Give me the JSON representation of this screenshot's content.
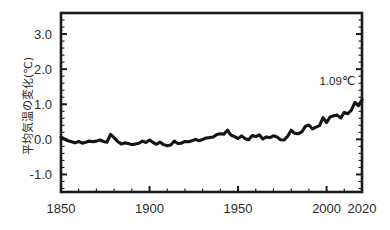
{
  "chart_data": {
    "type": "line",
    "title": "",
    "subtitle": "",
    "xlabel": "",
    "ylabel": "平均気温の変化(℃)",
    "xlim": [
      1850,
      2020
    ],
    "ylim": [
      -1.5,
      3.6
    ],
    "grid": false,
    "legend": null,
    "x_ticks": [
      1850,
      1900,
      1950,
      2000,
      2020
    ],
    "x_tick_labels": [
      "1850",
      "1900",
      "1950",
      "2000",
      "2020"
    ],
    "x_minor_step": 10,
    "y_ticks": [
      -1.0,
      0.0,
      1.0,
      2.0,
      3.0
    ],
    "y_tick_labels": [
      "-1.0",
      "0.0",
      "1.0",
      "2.0",
      "3.0"
    ],
    "y_minor_step": 0.2,
    "series": [
      {
        "name": "世界平均気温の変化",
        "color": "#141414",
        "x": [
          1850,
          1852,
          1854,
          1856,
          1858,
          1860,
          1862,
          1864,
          1866,
          1868,
          1870,
          1872,
          1874,
          1876,
          1878,
          1880,
          1882,
          1884,
          1886,
          1888,
          1890,
          1892,
          1894,
          1896,
          1898,
          1900,
          1902,
          1904,
          1906,
          1908,
          1910,
          1912,
          1914,
          1916,
          1918,
          1920,
          1922,
          1924,
          1926,
          1928,
          1930,
          1932,
          1934,
          1936,
          1938,
          1940,
          1942,
          1944,
          1946,
          1948,
          1950,
          1952,
          1954,
          1956,
          1958,
          1960,
          1962,
          1964,
          1966,
          1968,
          1970,
          1972,
          1974,
          1976,
          1978,
          1980,
          1982,
          1984,
          1986,
          1988,
          1990,
          1992,
          1994,
          1996,
          1998,
          2000,
          2002,
          2004,
          2006,
          2008,
          2010,
          2012,
          2014,
          2016,
          2018,
          2020
        ],
        "y": [
          0.06,
          0.01,
          -0.04,
          -0.07,
          -0.1,
          -0.06,
          -0.11,
          -0.08,
          -0.05,
          -0.07,
          -0.05,
          -0.02,
          -0.06,
          -0.08,
          0.14,
          0.05,
          -0.06,
          -0.13,
          -0.1,
          -0.12,
          -0.15,
          -0.13,
          -0.11,
          -0.05,
          -0.09,
          -0.02,
          -0.09,
          -0.14,
          -0.08,
          -0.15,
          -0.18,
          -0.16,
          -0.05,
          -0.12,
          -0.11,
          -0.06,
          -0.07,
          -0.04,
          0.0,
          -0.04,
          0.0,
          0.04,
          0.05,
          0.07,
          0.14,
          0.16,
          0.15,
          0.26,
          0.12,
          0.08,
          0.02,
          0.1,
          0.02,
          -0.01,
          0.11,
          0.08,
          0.13,
          0.01,
          0.07,
          0.05,
          0.1,
          0.07,
          -0.01,
          -0.02,
          0.09,
          0.26,
          0.17,
          0.16,
          0.21,
          0.37,
          0.41,
          0.3,
          0.35,
          0.39,
          0.62,
          0.48,
          0.64,
          0.67,
          0.69,
          0.61,
          0.77,
          0.73,
          0.83,
          1.05,
          0.96,
          1.13
        ],
        "end_value": 1.09
      }
    ],
    "annotations": [
      {
        "text": "1.09℃",
        "x": 2006,
        "y": 1.55,
        "name": "end-value-annotation"
      }
    ]
  },
  "axis_label_text": "平均気温の変化(℃)"
}
